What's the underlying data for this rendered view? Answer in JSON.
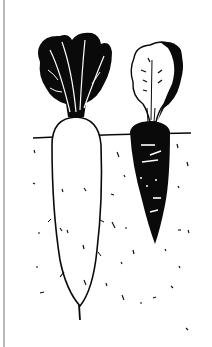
{
  "illustration": {
    "subject": "Radish and carrot growing in soil",
    "style": "black ink woodcut drawing",
    "elements": [
      {
        "name": "radish",
        "body": "white with black outline",
        "leaves": "black with white veins"
      },
      {
        "name": "carrot",
        "body": "black with white marks",
        "leaves": "white outlined with black edge"
      }
    ],
    "colors": {
      "ink": "#0a0a0a",
      "paper": "#ffffff",
      "frame_line": "#b9b9b9"
    }
  }
}
